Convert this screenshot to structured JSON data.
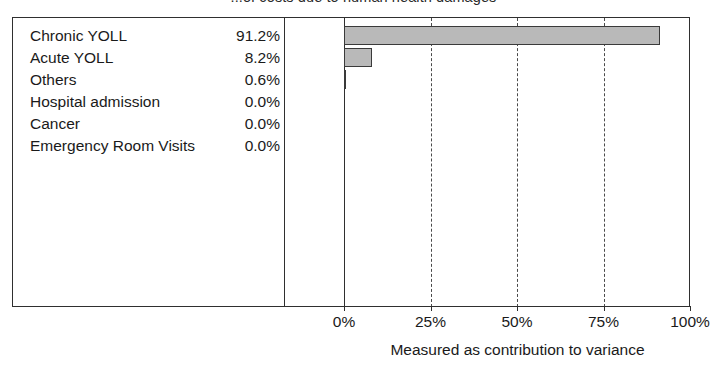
{
  "chart_data": {
    "type": "bar",
    "orientation": "horizontal",
    "title": "...of costs due to human health damages",
    "xlabel": "Measured as contribution to variance",
    "ylabel": "",
    "categories": [
      "Chronic YOLL",
      "Acute YOLL",
      "Others",
      "Hospital admission",
      "Cancer",
      "Emergency Room Visits"
    ],
    "values": [
      91.2,
      8.2,
      0.6,
      0.0,
      0.0,
      0.0
    ],
    "value_labels": [
      "91.2%",
      "8.2%",
      "0.6%",
      "0.0%",
      "0.0%",
      "0.0%"
    ],
    "xlim": [
      0,
      100
    ],
    "xticks": [
      0,
      25,
      50,
      75,
      100
    ],
    "xtick_labels": [
      "0%",
      "25%",
      "50%",
      "75%",
      "100%"
    ],
    "grid": true,
    "gridlines_at": [
      25,
      50,
      75
    ],
    "legend": false,
    "bar_fill_color": "#b9b9b9",
    "bar_border_color": "#3a3a3a",
    "frame_color": "#2f2f2f",
    "background_color": "#ffffff"
  }
}
